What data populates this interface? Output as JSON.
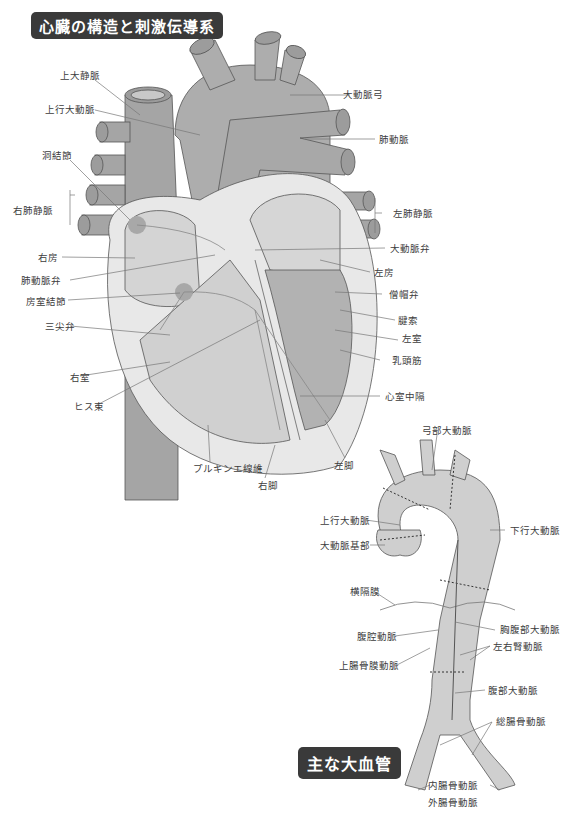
{
  "heart_section": {
    "title": "心臓の構造と刺激伝導系",
    "labels": {
      "svc": "上大静脈",
      "ascending_aorta": "上行大動脈",
      "sa_node": "洞結節",
      "right_pulm_vein": "右肺静脈",
      "right_atrium": "右房",
      "pulm_valve": "肺動脈弁",
      "av_node": "房室結節",
      "tricuspid": "三尖弁",
      "right_ventricle": "右室",
      "his_bundle": "ヒス束",
      "purkinje": "プルキンエ線維",
      "right_bundle": "右脚",
      "left_bundle": "左脚",
      "aortic_arch": "大動脈弓",
      "pulm_artery": "肺動脈",
      "left_pulm_vein": "左肺静脈",
      "aortic_valve": "大動脈弁",
      "left_atrium": "左房",
      "mitral": "僧帽弁",
      "chordae": "腱索",
      "left_ventricle": "左室",
      "papillary": "乳頭筋",
      "septum": "心室中隔"
    }
  },
  "vessels_section": {
    "title": "主な大血管",
    "labels": {
      "arch": "弓部大動脈",
      "ascending": "上行大動脈",
      "root": "大動脈基部",
      "descending": "下行大動脈",
      "diaphragm": "横隔膜",
      "thoracoabdominal": "胸腹部大動脈",
      "celiac": "腹腔動脈",
      "renal": "左右腎動脈",
      "sma": "上腸骨膜動脈",
      "abdominal": "腹部大動脈",
      "common_iliac": "総腸骨動脈",
      "internal_iliac": "内腸骨動脈",
      "external_iliac": "外腸骨動脈"
    }
  },
  "colors": {
    "dark_gray": "#9a9a9a",
    "mid_gray": "#b4b4b4",
    "light_gray": "#d6d6d6",
    "pale": "#ececec",
    "badge": "#3a3a3a",
    "node": "#a8a8a8"
  }
}
